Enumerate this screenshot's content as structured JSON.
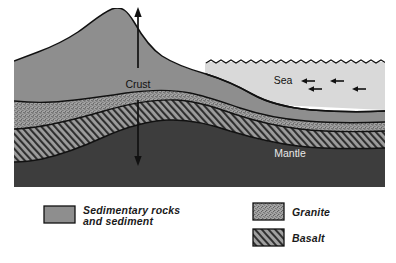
{
  "diagram": {
    "type": "geological-cross-section",
    "title": "",
    "labels": {
      "crust": "Crust",
      "mantle": "Mantle",
      "sea": "Sea"
    },
    "annotations": {
      "crust_thickness_arrow": "double-headed-vertical-arrow",
      "sea_current_arrows": [
        "left",
        "left",
        "left",
        "left"
      ]
    },
    "layers": [
      {
        "key": "sediment",
        "name": "Sedimentary rocks and sediment",
        "color": "#8e8e8e",
        "pattern": "solid"
      },
      {
        "key": "granite",
        "name": "Granite",
        "color": "#9a9a9a",
        "pattern": "stipple"
      },
      {
        "key": "basalt",
        "name": "Basalt",
        "color": "#8a8a8a",
        "pattern": "diagonal-hatch"
      },
      {
        "key": "mantle",
        "name": "Mantle",
        "color": "#3d3d3d",
        "pattern": "solid"
      },
      {
        "key": "sea",
        "name": "Sea",
        "color": "#d8d8d8",
        "pattern": "solid"
      }
    ]
  },
  "legend": {
    "items": [
      {
        "label": "Sedimentary rocks",
        "label2": "and sediment",
        "pattern": "solid",
        "color": "#8e8e8e"
      },
      {
        "label": "Granite",
        "label2": "",
        "pattern": "stipple",
        "color": "#9a9a9a"
      },
      {
        "label": "Basalt",
        "label2": "",
        "pattern": "diagonal-hatch",
        "color": "#8a8a8a"
      }
    ]
  },
  "colors": {
    "sediment": "#8e8e8e",
    "granite": "#9a9a9a",
    "basalt": "#8a8a8a",
    "mantle": "#3d3d3d",
    "sea": "#d8d8d8",
    "outline": "#111111",
    "background": "#ffffff"
  }
}
